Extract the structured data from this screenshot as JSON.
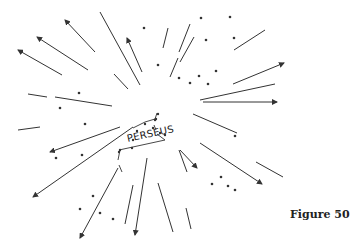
{
  "figure": {
    "label": "PERSEUS",
    "caption": "Figure 50"
  },
  "colors": {
    "ink": "#333333",
    "background": "#ffffff"
  },
  "streaks": [
    {
      "x1": 95,
      "y1": 52,
      "x2": 65,
      "y2": 20,
      "arrow": true
    },
    {
      "x1": 88,
      "y1": 70,
      "x2": 37,
      "y2": 37,
      "arrow": true
    },
    {
      "x1": 62,
      "y1": 75,
      "x2": 18,
      "y2": 50,
      "arrow": true
    },
    {
      "x1": 140,
      "y1": 85,
      "x2": 100,
      "y2": 12,
      "arrow": false
    },
    {
      "x1": 142,
      "y1": 72,
      "x2": 127,
      "y2": 38,
      "arrow": true
    },
    {
      "x1": 128,
      "y1": 89,
      "x2": 114,
      "y2": 74,
      "arrow": false
    },
    {
      "x1": 28,
      "y1": 94,
      "x2": 47,
      "y2": 97,
      "arrow": false
    },
    {
      "x1": 55,
      "y1": 97,
      "x2": 112,
      "y2": 106,
      "arrow": false
    },
    {
      "x1": 163,
      "y1": 48,
      "x2": 168,
      "y2": 28,
      "arrow": false
    },
    {
      "x1": 170,
      "y1": 77,
      "x2": 178,
      "y2": 58,
      "arrow": false
    },
    {
      "x1": 179,
      "y1": 52,
      "x2": 190,
      "y2": 24,
      "arrow": false
    },
    {
      "x1": 180,
      "y1": 62,
      "x2": 194,
      "y2": 37,
      "arrow": false
    },
    {
      "x1": 234,
      "y1": 50,
      "x2": 265,
      "y2": 30,
      "arrow": false
    },
    {
      "x1": 233,
      "y1": 84,
      "x2": 284,
      "y2": 63,
      "arrow": true
    },
    {
      "x1": 200,
      "y1": 100,
      "x2": 275,
      "y2": 84,
      "arrow": false
    },
    {
      "x1": 203,
      "y1": 102,
      "x2": 277,
      "y2": 102,
      "arrow": true
    },
    {
      "x1": 193,
      "y1": 114,
      "x2": 237,
      "y2": 133,
      "arrow": false
    },
    {
      "x1": 18,
      "y1": 130,
      "x2": 40,
      "y2": 127,
      "arrow": false
    },
    {
      "x1": 120,
      "y1": 127,
      "x2": 50,
      "y2": 152,
      "arrow": true
    },
    {
      "x1": 133,
      "y1": 127,
      "x2": 33,
      "y2": 197,
      "arrow": true
    },
    {
      "x1": 118,
      "y1": 168,
      "x2": 80,
      "y2": 238,
      "arrow": true
    },
    {
      "x1": 133,
      "y1": 185,
      "x2": 125,
      "y2": 224,
      "arrow": false
    },
    {
      "x1": 147,
      "y1": 158,
      "x2": 135,
      "y2": 235,
      "arrow": true
    },
    {
      "x1": 158,
      "y1": 183,
      "x2": 173,
      "y2": 232,
      "arrow": false
    },
    {
      "x1": 180,
      "y1": 150,
      "x2": 197,
      "y2": 168,
      "arrow": true
    },
    {
      "x1": 200,
      "y1": 143,
      "x2": 262,
      "y2": 184,
      "arrow": true
    },
    {
      "x1": 256,
      "y1": 162,
      "x2": 283,
      "y2": 177,
      "arrow": false
    },
    {
      "x1": 179,
      "y1": 150,
      "x2": 187,
      "y2": 172,
      "arrow": false
    },
    {
      "x1": 186,
      "y1": 208,
      "x2": 191,
      "y2": 229,
      "arrow": false
    }
  ],
  "stars": [
    {
      "x": 144,
      "y": 28
    },
    {
      "x": 201,
      "y": 18
    },
    {
      "x": 230,
      "y": 17
    },
    {
      "x": 206,
      "y": 40
    },
    {
      "x": 234,
      "y": 38
    },
    {
      "x": 158,
      "y": 65
    },
    {
      "x": 179,
      "y": 78
    },
    {
      "x": 190,
      "y": 83
    },
    {
      "x": 199,
      "y": 76
    },
    {
      "x": 208,
      "y": 84
    },
    {
      "x": 216,
      "y": 71
    },
    {
      "x": 79,
      "y": 93
    },
    {
      "x": 60,
      "y": 108
    },
    {
      "x": 85,
      "y": 124
    },
    {
      "x": 56,
      "y": 158
    },
    {
      "x": 82,
      "y": 155
    },
    {
      "x": 235,
      "y": 136
    },
    {
      "x": 93,
      "y": 196
    },
    {
      "x": 80,
      "y": 209
    },
    {
      "x": 100,
      "y": 213
    },
    {
      "x": 113,
      "y": 219
    },
    {
      "x": 212,
      "y": 184
    },
    {
      "x": 221,
      "y": 177
    },
    {
      "x": 228,
      "y": 186
    },
    {
      "x": 235,
      "y": 190
    }
  ],
  "constellation": {
    "points": [
      [
        132,
        148
      ],
      [
        133,
        140
      ],
      [
        137,
        131
      ],
      [
        145,
        124
      ],
      [
        155,
        120
      ],
      [
        158,
        114
      ],
      [
        156,
        119
      ],
      [
        153,
        128
      ],
      [
        160,
        133
      ],
      [
        165,
        135
      ],
      [
        120,
        150
      ],
      [
        119,
        152
      ]
    ],
    "lines": [
      [
        [
          133,
          128
        ],
        [
          145,
          122
        ]
      ],
      [
        [
          145,
          122
        ],
        [
          155,
          119
        ]
      ],
      [
        [
          155,
          119
        ],
        [
          157,
          113
        ]
      ],
      [
        [
          154,
          125
        ],
        [
          156,
          130
        ]
      ],
      [
        [
          157,
          134
        ],
        [
          165,
          140
        ]
      ],
      [
        [
          165,
          140
        ],
        [
          119,
          150
        ]
      ],
      [
        [
          120,
          150
        ],
        [
          118,
          160
        ]
      ],
      [
        [
          119,
          165
        ],
        [
          122,
          172
        ]
      ]
    ]
  }
}
